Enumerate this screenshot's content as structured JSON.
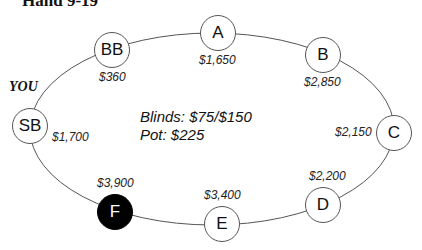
{
  "title": "Hand 9-19",
  "hero_label": "YOU",
  "info": {
    "blinds": "Blinds: $75/$150",
    "pot": "Pot: $225"
  },
  "seats": [
    {
      "id": "BB",
      "label": "BB",
      "stack": "$360",
      "active": false
    },
    {
      "id": "A",
      "label": "A",
      "stack": "$1,650",
      "active": false
    },
    {
      "id": "B",
      "label": "B",
      "stack": "$2,850",
      "active": false
    },
    {
      "id": "C",
      "label": "C",
      "stack": "$2,150",
      "active": false
    },
    {
      "id": "D",
      "label": "D",
      "stack": "$2,200",
      "active": false
    },
    {
      "id": "E",
      "label": "E",
      "stack": "$3,400",
      "active": false
    },
    {
      "id": "F",
      "label": "F",
      "stack": "$3,900",
      "active": true
    },
    {
      "id": "SB",
      "label": "SB",
      "stack": "$1,700",
      "active": false,
      "hero": true
    }
  ],
  "colors": {
    "table_line": "#555555",
    "active_seat": "#000000",
    "seat_fill": "#ffffff"
  }
}
